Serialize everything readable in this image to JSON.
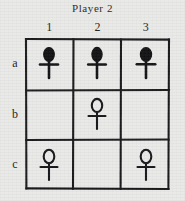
{
  "board": {
    "title": "Player 2",
    "column_headers": [
      "1",
      "2",
      "3"
    ],
    "row_headers": [
      "a",
      "b",
      "c"
    ],
    "ink_color": "#111114",
    "paper_color": "#e9e9e7",
    "cells": [
      {
        "id": "a1",
        "row": "a",
        "column": "1",
        "piece": "ankh-filled"
      },
      {
        "id": "a2",
        "row": "a",
        "column": "2",
        "piece": "ankh-filled"
      },
      {
        "id": "a3",
        "row": "a",
        "column": "3",
        "piece": "ankh-filled"
      },
      {
        "id": "b1",
        "row": "b",
        "column": "1",
        "piece": ""
      },
      {
        "id": "b2",
        "row": "b",
        "column": "2",
        "piece": "ankh-outline"
      },
      {
        "id": "b3",
        "row": "b",
        "column": "3",
        "piece": ""
      },
      {
        "id": "c1",
        "row": "c",
        "column": "1",
        "piece": "ankh-outline"
      },
      {
        "id": "c2",
        "row": "c",
        "column": "2",
        "piece": ""
      },
      {
        "id": "c3",
        "row": "c",
        "column": "3",
        "piece": "ankh-outline"
      }
    ]
  }
}
